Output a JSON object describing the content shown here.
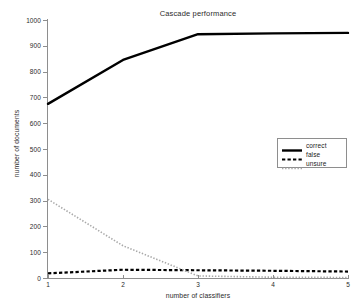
{
  "top_bleed": {
    "fragment_left": "",
    "fragment_right": ""
  },
  "chart_data": {
    "type": "line",
    "title": "Cascade performance",
    "xlabel": "number of classifiers",
    "ylabel": "number of documents",
    "x": [
      1,
      2,
      3,
      4,
      5
    ],
    "xlim": [
      1,
      5
    ],
    "ylim": [
      0,
      1000
    ],
    "xticks": [
      "1",
      "2",
      "3",
      "4",
      "5"
    ],
    "yticks": [
      "0",
      "100",
      "200",
      "300",
      "400",
      "500",
      "600",
      "700",
      "800",
      "900",
      "1000"
    ],
    "ytick_values": [
      0,
      100,
      200,
      300,
      400,
      500,
      600,
      700,
      800,
      900,
      1000
    ],
    "grid": false,
    "legend_position": "center right",
    "series": [
      {
        "name": "correct",
        "values": [
          675,
          845,
          945,
          948,
          950
        ],
        "style": "solid",
        "color": "#000000",
        "width": 2.4
      },
      {
        "name": "false",
        "values": [
          18,
          32,
          30,
          28,
          25
        ],
        "style": "dashed",
        "color": "#000000",
        "width": 2.2
      },
      {
        "name": "unsure",
        "values": [
          305,
          125,
          8,
          3,
          2
        ],
        "style": "dotted",
        "color": "#a8a8a8",
        "width": 1.6
      }
    ]
  },
  "legend": {
    "items": [
      {
        "label": "correct"
      },
      {
        "label": "false"
      },
      {
        "label": "unsure"
      }
    ]
  }
}
